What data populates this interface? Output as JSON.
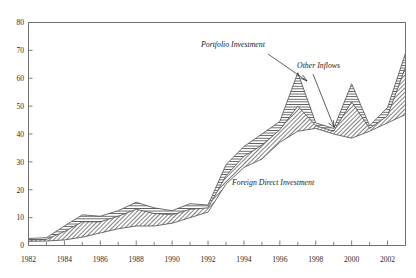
{
  "chart_data": {
    "type": "area",
    "title": "",
    "subtitle": "",
    "xlabel": "",
    "ylabel": "",
    "xlim": [
      1982,
      2003
    ],
    "ylim": [
      0,
      80
    ],
    "grid": false,
    "legend_position": "inline-annotations",
    "stacked": true,
    "x": [
      1982,
      1983,
      1984,
      1985,
      1986,
      1987,
      1988,
      1989,
      1990,
      1991,
      1992,
      1993,
      1994,
      1995,
      1996,
      1997,
      1998,
      1999,
      2000,
      2001,
      2002,
      2003
    ],
    "x_tick_labels": [
      "1982",
      "1984",
      "1986",
      "1988",
      "1990",
      "1992",
      "1994",
      "1996",
      "1998",
      "2000",
      "2002"
    ],
    "x_tick_values": [
      1982,
      1984,
      1986,
      1988,
      1990,
      1992,
      1994,
      1996,
      1998,
      2000,
      2002
    ],
    "x_minor_tick_values": [
      1983,
      1985,
      1987,
      1989,
      1991,
      1993,
      1995,
      1997,
      1999,
      2001,
      2003
    ],
    "y_tick_labels": [
      "0",
      "10",
      "20",
      "30",
      "40",
      "50",
      "60",
      "70",
      "80"
    ],
    "y_tick_values": [
      0,
      10,
      20,
      30,
      40,
      50,
      60,
      70,
      80
    ],
    "series": [
      {
        "name": "Foreign Direct Investment",
        "fill": "blank",
        "values": [
          1.5,
          1.6,
          2.0,
          3.0,
          4.5,
          6.0,
          7.0,
          7.0,
          8.0,
          10.0,
          12.0,
          22.0,
          28.0,
          31.0,
          37.0,
          41.0,
          42.0,
          40.0,
          38.5,
          41.0,
          44.0,
          47.0
        ]
      },
      {
        "name": "Portfolio Investment",
        "fill": "diagonal-hatch",
        "values": [
          0.5,
          0.6,
          3.0,
          5.5,
          4.0,
          4.5,
          6.0,
          4.5,
          3.0,
          3.0,
          1.5,
          3.0,
          4.0,
          5.0,
          4.5,
          9.0,
          1.0,
          1.0,
          13.0,
          1.0,
          2.5,
          17.0
        ]
      },
      {
        "name": "Other Inflows",
        "fill": "horizontal-hatch",
        "values": [
          0.5,
          0.6,
          2.0,
          2.5,
          2.0,
          2.0,
          2.5,
          2.0,
          1.5,
          2.0,
          1.0,
          4.0,
          3.5,
          4.0,
          3.0,
          12.0,
          1.0,
          1.0,
          6.5,
          1.0,
          3.0,
          5.0
        ]
      }
    ],
    "totals": [
      2.5,
      2.8,
      7.0,
      11.0,
      10.5,
      12.5,
      15.5,
      13.5,
      12.5,
      15.0,
      14.5,
      29.0,
      35.5,
      40.0,
      44.5,
      62.0,
      44.0,
      42.0,
      58.0,
      43.0,
      49.5,
      69.0
    ],
    "annotations": [
      {
        "text": "Portfolio Investment",
        "x": 201,
        "y": 47
      },
      {
        "text": "Other Inflows",
        "x": 297,
        "y": 68
      },
      {
        "text": "Foreign Direct Investment",
        "x": 232,
        "y": 185
      }
    ]
  },
  "axes": {
    "y_label_x": 22,
    "x_label_y": 262
  }
}
